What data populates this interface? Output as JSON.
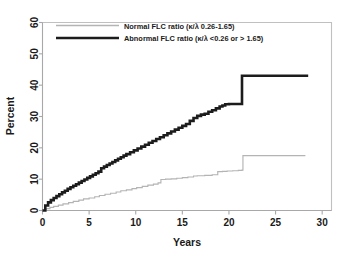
{
  "chart_data": {
    "type": "line",
    "title": "",
    "subtitle": "",
    "xlabel": "Years",
    "ylabel": "Percent",
    "xlim": [
      0,
      31
    ],
    "ylim": [
      0,
      60
    ],
    "xticks": [
      0,
      5,
      10,
      15,
      20,
      25,
      30
    ],
    "xtick_labels": [
      "0",
      "5",
      "10",
      "15",
      "20",
      "25",
      "30"
    ],
    "yticks": [
      0,
      10,
      20,
      30,
      40,
      50,
      60
    ],
    "ytick_labels": [
      "0",
      "10",
      "20",
      "30",
      "40",
      "50",
      "60"
    ],
    "grid": false,
    "legend_position": "top-left-inside",
    "series": [
      {
        "name": "Normal FLC ratio (κ/λ 0.26-1.65)",
        "color": "#b4b4b4",
        "style": "step",
        "linewidth_px": 1.15,
        "x": [
          0,
          0.4,
          0.8,
          1.2,
          1.7,
          2.2,
          2.8,
          3.3,
          3.9,
          4.4,
          5.0,
          5.6,
          6.1,
          6.7,
          7.3,
          7.9,
          8.4,
          9.0,
          9.6,
          10.1,
          10.7,
          11.3,
          11.9,
          12.4,
          12.7,
          13.2,
          13.8,
          14.4,
          15.0,
          15.6,
          16.2,
          16.6,
          17.4,
          18.2,
          18.8,
          19.3,
          19.8,
          20.4,
          21.0,
          21.4,
          21.5,
          23.0,
          25.0,
          27.0,
          28.2
        ],
        "y": [
          0.0,
          0.6,
          1.0,
          1.3,
          1.7,
          2.1,
          2.5,
          2.9,
          3.3,
          3.7,
          4.0,
          4.4,
          4.8,
          5.2,
          5.5,
          5.9,
          6.3,
          6.6,
          7.0,
          7.3,
          7.7,
          8.1,
          8.4,
          8.8,
          9.9,
          10.0,
          10.1,
          10.3,
          10.5,
          10.7,
          11.0,
          11.1,
          11.2,
          11.4,
          12.4,
          12.5,
          12.6,
          12.7,
          12.8,
          12.9,
          17.5,
          17.5,
          17.5,
          17.5,
          17.5
        ]
      },
      {
        "name": "Abnormal FLC ratio (κ/λ <0.26 or > 1.65)",
        "color": "#1c1c1c",
        "style": "step",
        "linewidth_px": 2.6,
        "x": [
          0,
          0.3,
          0.6,
          0.9,
          1.2,
          1.5,
          1.8,
          2.1,
          2.4,
          2.7,
          3.0,
          3.3,
          3.6,
          3.9,
          4.2,
          4.5,
          4.8,
          5.1,
          5.4,
          5.7,
          6.0,
          6.3,
          6.6,
          6.9,
          7.2,
          7.5,
          7.8,
          8.1,
          8.4,
          8.7,
          9.0,
          9.4,
          9.8,
          10.2,
          10.6,
          11.0,
          11.4,
          11.8,
          12.2,
          12.6,
          13.0,
          13.4,
          13.8,
          14.2,
          14.6,
          15.0,
          15.4,
          15.8,
          16.2,
          16.6,
          17.0,
          17.4,
          17.8,
          18.2,
          18.6,
          19.0,
          19.3,
          19.6,
          20.0,
          20.5,
          21.0,
          21.3,
          21.4,
          23.0,
          25.0,
          27.0,
          28.5
        ],
        "y": [
          0.0,
          1.6,
          2.6,
          3.3,
          4.0,
          4.6,
          5.2,
          5.8,
          6.3,
          6.9,
          7.4,
          7.9,
          8.4,
          8.9,
          9.4,
          9.9,
          10.4,
          10.9,
          11.4,
          11.9,
          12.4,
          13.5,
          14.0,
          14.5,
          15.0,
          15.5,
          16.0,
          16.5,
          17.0,
          17.5,
          18.0,
          18.6,
          19.2,
          19.8,
          20.4,
          21.0,
          21.6,
          22.2,
          22.8,
          23.4,
          24.0,
          24.6,
          25.2,
          25.8,
          26.4,
          27.0,
          27.6,
          28.6,
          29.5,
          30.2,
          30.6,
          30.9,
          31.5,
          32.0,
          32.6,
          33.2,
          33.5,
          33.9,
          34.0,
          34.0,
          34.0,
          34.0,
          43.0,
          43.0,
          43.0,
          43.0,
          43.0
        ]
      }
    ]
  },
  "axes": {
    "x_title": "Years",
    "y_title": "Percent",
    "x_ticks": [
      "0",
      "5",
      "10",
      "15",
      "20",
      "25",
      "30"
    ],
    "y_ticks": [
      "0",
      "10",
      "20",
      "30",
      "40",
      "50",
      "60"
    ]
  },
  "legend": {
    "entries": [
      {
        "label": "Normal FLC ratio (κ/λ 0.26-1.65)",
        "color": "#b4b4b4"
      },
      {
        "label": "Abnormal FLC ratio (κ/λ <0.26 or > 1.65)",
        "color": "#1c1c1c"
      }
    ]
  }
}
